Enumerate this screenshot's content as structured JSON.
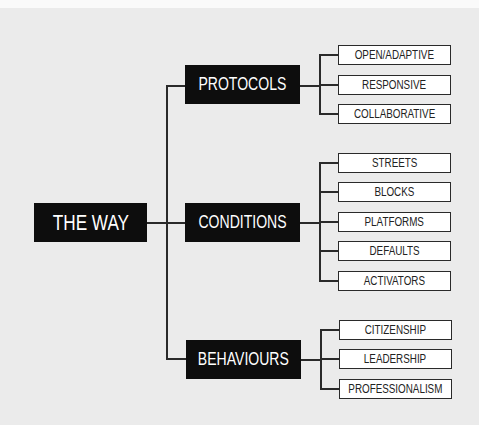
{
  "diagram": {
    "root": {
      "label": "THE WAY"
    },
    "branches": [
      {
        "label": "PROTOCOLS",
        "children": [
          "OPEN/ADAPTIVE",
          "RESPONSIVE",
          "COLLABORATIVE"
        ]
      },
      {
        "label": "CONDITIONS",
        "children": [
          "STREETS",
          "BLOCKS",
          "PLATFORMS",
          "DEFAULTS",
          "ACTIVATORS"
        ]
      },
      {
        "label": "BEHAVIOURS",
        "children": [
          "CITIZENSHIP",
          "LEADERSHIP",
          "PROFESSIONALISM"
        ]
      }
    ],
    "colors": {
      "background": "#ebebeb",
      "dark_box": "#0d0d0d",
      "dark_text": "#ffffff",
      "leaf_box": "#ffffff",
      "connector": "#2a2a2a"
    }
  }
}
